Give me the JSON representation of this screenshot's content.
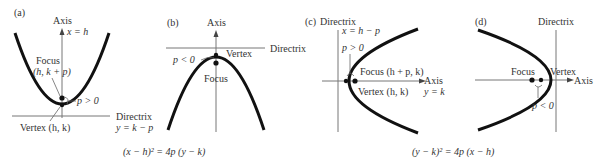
{
  "panels": [
    {
      "id": "a",
      "tag": "(a)",
      "axis_label": "Axis",
      "axis_eq": "x = h",
      "focus_label": "Focus",
      "focus_coords": "(h, k + p)",
      "p_label": "p > 0",
      "vertex_label": "Vertex (h, k)",
      "directrix_label": "Directrix",
      "directrix_eq": "y = k − p"
    },
    {
      "id": "b",
      "tag": "(b)",
      "axis_label": "Axis",
      "directrix_label": "Directrix",
      "vertex_label": "Vertex",
      "p_label": "p < 0",
      "focus_label": "Focus"
    },
    {
      "id": "c",
      "tag": "(c)",
      "directrix_label": "Directrix",
      "directrix_eq": "x = h − p",
      "p_label": "p > 0",
      "focus_label": "Focus (h + p, k)",
      "vertex_label": "Vertex (h, k)",
      "axis_label": "Axis",
      "axis_eq": "y = k"
    },
    {
      "id": "d",
      "tag": "(d)",
      "directrix_label": "Directrix",
      "focus_label": "Focus",
      "vertex_label": "Vertex",
      "axis_label": "Axis",
      "p_label": "p < 0"
    }
  ],
  "equations": {
    "vertical": "(x − h)² = 4p (y − k)",
    "horizontal": "(y − k)² = 4p (x − h)"
  }
}
